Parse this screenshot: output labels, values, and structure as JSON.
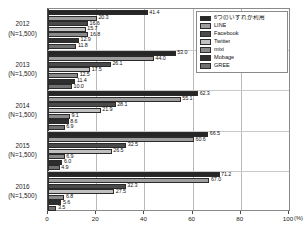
{
  "chart_data": {
    "type": "bar",
    "orientation": "horizontal",
    "title": "",
    "xlabel": "(%)",
    "ylabel": "",
    "xlim": [
      0,
      100
    ],
    "xticks": [
      0,
      20,
      40,
      60,
      80,
      100
    ],
    "xtick_labels": [
      "0",
      "20",
      "40",
      "60",
      "80",
      "100"
    ],
    "unit_label": "(%)",
    "grid": true,
    "legend_position": "top-right",
    "categories": [
      "2012",
      "2013",
      "2014",
      "2015",
      "2016"
    ],
    "category_sublabels": [
      "(N=1,500)",
      "(N=1,500)",
      "(N=1,500)",
      "(N=1,500)",
      "(N=1,500)"
    ],
    "series": [
      {
        "name": "6つのいずれか利用",
        "color": "#262626",
        "values": [
          41.4,
          53.0,
          62.3,
          66.5,
          71.2
        ]
      },
      {
        "name": "LINE",
        "color": "#9e9e9e",
        "values": [
          20.3,
          44.0,
          55.1,
          60.6,
          67.0
        ]
      },
      {
        "name": "Facebook",
        "color": "#4a4a4a",
        "values": [
          16.6,
          26.1,
          28.1,
          32.5,
          32.3
        ]
      },
      {
        "name": "Twitter",
        "color": "#c0c0c0",
        "values": [
          15.7,
          17.5,
          21.9,
          26.5,
          27.5
        ]
      },
      {
        "name": "mixi",
        "color": "#8a8a8a",
        "values": [
          16.8,
          12.5,
          9.1,
          6.9,
          6.8
        ]
      },
      {
        "name": "Mobage",
        "color": "#2e2e2e",
        "values": [
          12.9,
          11.4,
          8.6,
          6.0,
          5.6
        ]
      },
      {
        "name": "GREE",
        "color": "#707070",
        "values": [
          11.8,
          10.0,
          6.9,
          4.9,
          3.5
        ]
      }
    ]
  }
}
